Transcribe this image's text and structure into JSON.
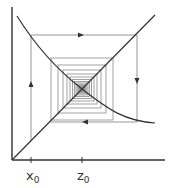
{
  "diagram": {
    "type": "cobweb",
    "colors": {
      "axis": "#333333",
      "curve": "#333333",
      "diagonal": "#333333",
      "cobweb": "#8a8a8a",
      "background": "#ffffff"
    },
    "axes": {
      "origin": [
        12,
        160
      ],
      "y_top": 7,
      "x_right": 165
    },
    "diagonal": {
      "from": [
        12,
        160
      ],
      "to": [
        155,
        15
      ]
    },
    "curve": {
      "from": [
        17,
        16
      ],
      "through": [
        82,
        89
      ],
      "to": [
        155,
        123
      ]
    },
    "fixed_point": [
      82,
      89
    ],
    "ticks": [
      {
        "name": "x0",
        "x": 31,
        "base": "x",
        "subscript": "0"
      },
      {
        "name": "z0",
        "x": 82,
        "base": "z",
        "subscript": "0"
      }
    ],
    "outer_path": {
      "points": [
        [
          31,
          140
        ],
        [
          31,
          35
        ],
        [
          137,
          35
        ],
        [
          137,
          122
        ],
        [
          51,
          122
        ]
      ]
    },
    "arrows": [
      {
        "name": "up-arrow",
        "at": [
          31,
          85
        ],
        "direction": "up"
      },
      {
        "name": "right-arrow",
        "at": [
          80,
          35
        ],
        "direction": "right"
      },
      {
        "name": "down-arrow",
        "at": [
          137,
          80
        ],
        "direction": "down"
      },
      {
        "name": "left-arrow",
        "at": [
          86,
          122
        ],
        "direction": "left"
      }
    ],
    "inner_box_half_sizes": [
      31,
      24,
      19,
      15,
      12,
      9.5,
      7.5,
      6,
      4.8,
      3.8,
      3,
      2.3,
      1.7,
      1.2
    ]
  }
}
